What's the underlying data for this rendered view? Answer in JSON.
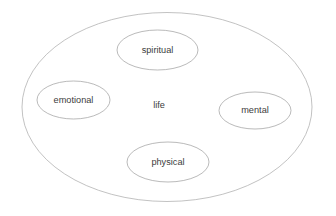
{
  "diagram": {
    "type": "venn-containment",
    "background_color": "#ffffff",
    "stroke_color": "#9c9c9c",
    "text_color": "#3c3c3c",
    "container": {
      "label": "life",
      "label_x": 159,
      "label_y": 106,
      "cx": 167,
      "cy": 107,
      "rx": 145,
      "ry": 94.5
    },
    "nodes": [
      {
        "id": "spiritual",
        "label": "spiritual",
        "cx": 157.5,
        "cy": 50,
        "rx": 40.5,
        "ry": 20
      },
      {
        "id": "emotional",
        "label": "emotional",
        "cx": 73.5,
        "cy": 100,
        "rx": 36.5,
        "ry": 19
      },
      {
        "id": "mental",
        "label": "mental",
        "cx": 255,
        "cy": 110.5,
        "rx": 36,
        "ry": 18.5
      },
      {
        "id": "physical",
        "label": "physical",
        "cx": 168,
        "cy": 162,
        "rx": 41,
        "ry": 20
      }
    ]
  }
}
